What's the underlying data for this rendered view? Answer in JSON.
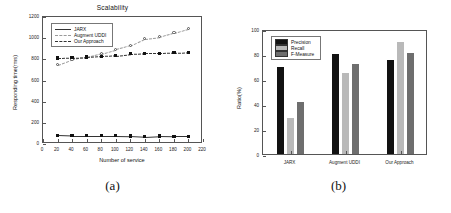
{
  "figure": {
    "panel_a_caption": "(a)",
    "panel_b_caption": "(b)"
  },
  "colors": {
    "precision": "#121212",
    "recall": "#b9b9b9",
    "f_measure": "#6e6e6e",
    "axis": "#555555",
    "line_dark": "#333333",
    "line_light": "#9a9a9a"
  },
  "chart_data": [
    {
      "type": "line",
      "panel": "a",
      "title": "Scalability",
      "xlabel": "Number of service",
      "ylabel": "Responding time(rms)",
      "xlim": [
        0,
        220
      ],
      "ylim": [
        0,
        1200
      ],
      "xticks": [
        0,
        20,
        40,
        60,
        80,
        100,
        120,
        140,
        160,
        180,
        200,
        220
      ],
      "yticks": [
        0,
        200,
        400,
        600,
        800,
        1000,
        1200
      ],
      "grid": false,
      "legend_position": "top-left",
      "x": [
        20,
        40,
        60,
        80,
        100,
        120,
        140,
        160,
        180,
        200
      ],
      "series": [
        {
          "name": "JARX",
          "marker": "filled-square",
          "line": "solid",
          "values": [
            82,
            78,
            78,
            78,
            78,
            75,
            68,
            76,
            74,
            73
          ]
        },
        {
          "name": "Augment UDDI",
          "marker": "open-circle",
          "line": "dashed-light",
          "values": [
            748,
            800,
            820,
            855,
            893,
            930,
            995,
            1012,
            1052,
            1090
          ]
        },
        {
          "name": "Our Approach",
          "marker": "filled-square",
          "line": "dashed",
          "values": [
            812,
            815,
            822,
            830,
            835,
            852,
            857,
            858,
            862,
            868
          ]
        }
      ]
    },
    {
      "type": "bar",
      "panel": "b",
      "title": "",
      "xlabel": "",
      "ylabel": "Ratio(%)",
      "ylim": [
        0,
        100
      ],
      "yticks": [
        0,
        20,
        40,
        60,
        80,
        100
      ],
      "grid": false,
      "legend_position": "top-left",
      "categories": [
        "JARX",
        "Augment UDDI",
        "Our Approach"
      ],
      "series": [
        {
          "name": "Precision",
          "values": [
            70,
            80,
            75
          ]
        },
        {
          "name": "Recall",
          "values": [
            29,
            65,
            90
          ]
        },
        {
          "name": "F-Measure",
          "values": [
            42,
            72,
            81
          ]
        }
      ]
    }
  ]
}
